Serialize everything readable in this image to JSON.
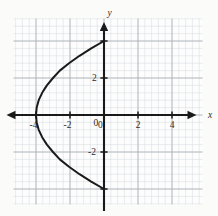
{
  "figure": {
    "background_color": "#fbfbfa",
    "plot_background_color": "#fdfdfd",
    "minor_grid_color": "#d8dce0",
    "major_grid_color": "#a8aeb4",
    "axis_color": "#1a1a1a",
    "curve_color": "#1a1a1a",
    "label_color": "#2b2b2b",
    "x_axis_name": "x",
    "y_axis_name": "y"
  },
  "chart_data": {
    "type": "line",
    "title": "",
    "xlabel": "x",
    "ylabel": "y",
    "xlim": [
      -5.4,
      5.4
    ],
    "ylim": [
      -5.2,
      5.2
    ],
    "grid": true,
    "minor_grid": true,
    "minor_grid_step": 0.4,
    "major_grid_step": 2,
    "legend": "none",
    "x_tick_labels": [
      "-4",
      "-2",
      "0",
      "2",
      "4"
    ],
    "x_tick_values": [
      -4,
      -2,
      0,
      2,
      4
    ],
    "y_tick_labels": [
      "2",
      "0",
      "-2"
    ],
    "y_tick_values": [
      2,
      0,
      -2
    ],
    "y_extra_tick_values": [
      4,
      -4
    ],
    "series": [
      {
        "name": "parabola",
        "equation": "x = y^2/4 - 4",
        "alt_equation": "y^2 = 4(x + 4)",
        "orientation": "opens-right",
        "vertex": [
          -4,
          0
        ],
        "endpoints": [
          [
            0,
            4
          ],
          [
            0,
            -4
          ]
        ],
        "points": [
          [
            0,
            -4.0
          ],
          [
            -0.7525,
            -3.6
          ],
          [
            -1.44,
            -3.2
          ],
          [
            -2.0575,
            -2.8
          ],
          [
            -2.6,
            -2.4
          ],
          [
            -3.0,
            -2.0
          ],
          [
            -3.36,
            -1.6
          ],
          [
            -3.6375,
            -1.2
          ],
          [
            -3.84,
            -0.8
          ],
          [
            -3.96,
            -0.4
          ],
          [
            -4.0,
            0.0
          ],
          [
            -3.96,
            0.4
          ],
          [
            -3.84,
            0.8
          ],
          [
            -3.6375,
            1.2
          ],
          [
            -3.36,
            1.6
          ],
          [
            -3.0,
            2.0
          ],
          [
            -2.6,
            2.4
          ],
          [
            -2.0575,
            2.8
          ],
          [
            -1.44,
            3.2
          ],
          [
            -0.7525,
            3.6
          ],
          [
            0,
            4.0
          ]
        ]
      }
    ]
  }
}
